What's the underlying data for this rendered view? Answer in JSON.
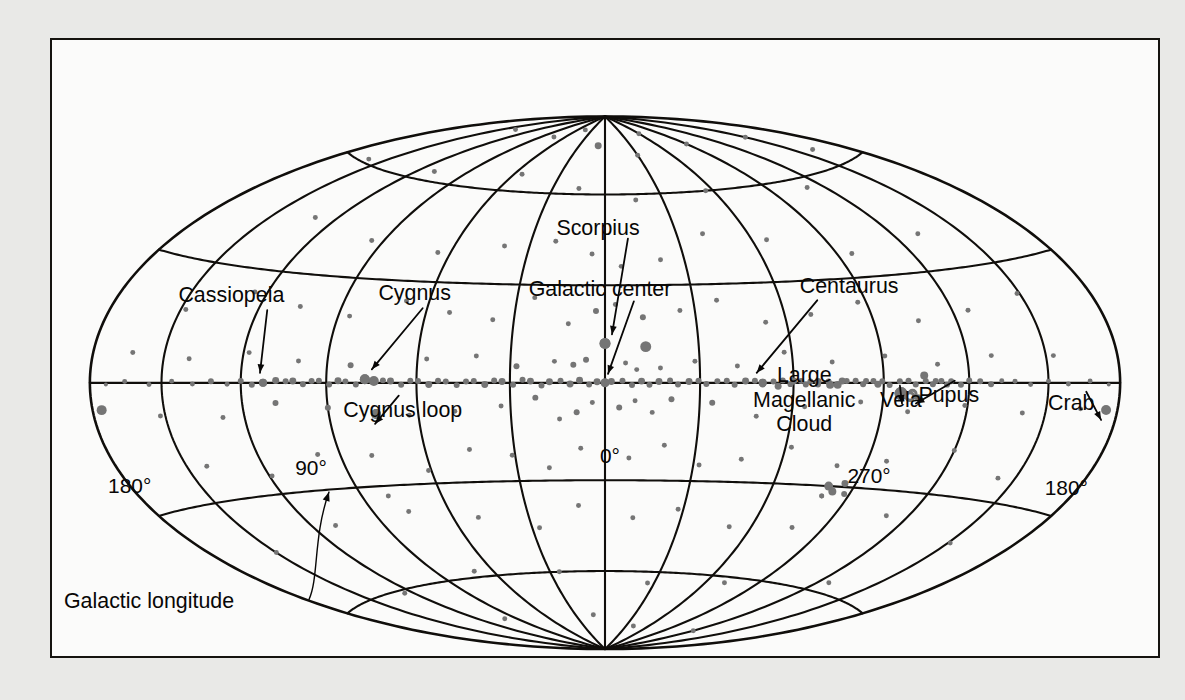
{
  "figure": {
    "kind": "all-sky-map",
    "projection": "Hammer-Aitoff",
    "coordinate_system": "galactic",
    "background_color": "#e9e9e7",
    "panel_color": "#fbfbfa",
    "line_color": "#100e0b",
    "source_color": "#757575"
  },
  "axis_labels": {
    "longitude_caption": "Galactic longitude",
    "ticks": [
      {
        "id": "left-180",
        "text": "180°",
        "x": 78,
        "y": 450
      },
      {
        "id": "left-90",
        "text": "90°",
        "x": 260,
        "y": 432
      },
      {
        "id": "center-0",
        "text": "0°",
        "x": 560,
        "y": 420
      },
      {
        "id": "right-270",
        "text": "270°",
        "x": 820,
        "y": 440
      },
      {
        "id": "right-180",
        "text": "180°",
        "x": 1018,
        "y": 452
      }
    ]
  },
  "annotations": [
    {
      "id": "scorpius",
      "lines": [
        "Scorpius"
      ],
      "x": 548,
      "y": 190,
      "anchor": "middle"
    },
    {
      "id": "galactic-center",
      "lines": [
        "Galactic center"
      ],
      "x": 550,
      "y": 252,
      "anchor": "middle"
    },
    {
      "id": "cassiopeia",
      "lines": [
        "Cassiopeia"
      ],
      "x": 180,
      "y": 258,
      "anchor": "middle"
    },
    {
      "id": "cygnus",
      "lines": [
        "Cygnus"
      ],
      "x": 364,
      "y": 256,
      "anchor": "middle"
    },
    {
      "id": "cygnus-loop",
      "lines": [
        "Cygnus loop"
      ],
      "x": 352,
      "y": 373,
      "anchor": "middle"
    },
    {
      "id": "centaurus",
      "lines": [
        "Centaurus"
      ],
      "x": 800,
      "y": 249,
      "anchor": "middle"
    },
    {
      "id": "lmc",
      "lines": [
        "Large",
        "Magellanic",
        "Cloud"
      ],
      "x": 755,
      "y": 338,
      "anchor": "middle"
    },
    {
      "id": "vela",
      "lines": [
        "Vela"
      ],
      "x": 852,
      "y": 363,
      "anchor": "middle"
    },
    {
      "id": "pupus",
      "lines": [
        "Pupus"
      ],
      "x": 900,
      "y": 358,
      "anchor": "middle"
    },
    {
      "id": "crab",
      "lines": [
        "Crab"
      ],
      "x": 1023,
      "y": 366,
      "anchor": "middle"
    }
  ],
  "chart_data": {
    "type": "scatter",
    "title": "",
    "projection": "Hammer-Aitoff all-sky (galactic coordinates)",
    "xlabel": "Galactic longitude",
    "ylabel": "Galactic latitude",
    "xlim": [
      180,
      -180
    ],
    "ylim": [
      -90,
      90
    ],
    "grid": true,
    "graticule": {
      "meridian_step_deg": 30,
      "parallel_step_deg": 30,
      "labeled_meridians": [
        180,
        90,
        0,
        270,
        180
      ],
      "labeled_parallels": []
    },
    "legend": "none",
    "marker_size_meaning": "source brightness / flux",
    "named_sources": [
      {
        "name": "Scorpius",
        "l": 0,
        "b": 12,
        "size": 11
      },
      {
        "name": "Galactic center",
        "l": 0,
        "b": 0,
        "size": 8
      },
      {
        "name": "Cassiopeia",
        "l": 112,
        "b": 0,
        "size": 8
      },
      {
        "name": "Cygnus",
        "l": 77,
        "b": 1,
        "size": 10
      },
      {
        "name": "Cygnus loop",
        "l": 74,
        "b": -9,
        "size": 10
      },
      {
        "name": "Centaurus",
        "l": 310,
        "b": 0,
        "size": 8
      },
      {
        "name": "Large Magellanic Cloud",
        "l": 280,
        "b": -33,
        "size": 5
      },
      {
        "name": "Vela",
        "l": 264,
        "b": -3,
        "size": 13,
        "marker": "disc"
      },
      {
        "name": "Pupus",
        "l": 260,
        "b": -3,
        "size": 7,
        "marker": "ring"
      },
      {
        "name": "Crab",
        "l": 185,
        "b": -6,
        "size": 10
      }
    ],
    "points": [
      [
        0.0,
        0.0,
        9
      ],
      [
        2.5,
        0.3,
        7
      ],
      [
        -2.0,
        0.4,
        7
      ],
      [
        5.0,
        -0.5,
        6
      ],
      [
        -5.5,
        0.6,
        6
      ],
      [
        8.0,
        0.8,
        7
      ],
      [
        -8.5,
        -0.7,
        6
      ],
      [
        11.0,
        -0.4,
        7
      ],
      [
        -11.5,
        0.5,
        7
      ],
      [
        14.0,
        0.6,
        6
      ],
      [
        -14.0,
        -0.6,
        6
      ],
      [
        17.5,
        0.3,
        7
      ],
      [
        -17.0,
        0.4,
        7
      ],
      [
        20.0,
        -0.8,
        6
      ],
      [
        -20.5,
        0.7,
        6
      ],
      [
        23.5,
        0.5,
        7
      ],
      [
        -23.0,
        -0.5,
        6
      ],
      [
        26.0,
        0.9,
        6
      ],
      [
        -26.5,
        0.4,
        7
      ],
      [
        29.0,
        -0.6,
        6
      ],
      [
        -29.5,
        0.6,
        6
      ],
      [
        32.5,
        0.4,
        7
      ],
      [
        -32.0,
        -0.4,
        6
      ],
      [
        35.0,
        0.7,
        6
      ],
      [
        -35.5,
        0.5,
        6
      ],
      [
        38.0,
        -0.5,
        7
      ],
      [
        -38.5,
        0.6,
        6
      ],
      [
        41.5,
        0.5,
        6
      ],
      [
        -41.0,
        -0.6,
        6
      ],
      [
        44.0,
        0.4,
        6
      ],
      [
        -44.5,
        0.5,
        7
      ],
      [
        47.0,
        -0.7,
        6
      ],
      [
        -47.5,
        0.6,
        6
      ],
      [
        50.5,
        0.4,
        6
      ],
      [
        -50.0,
        -0.5,
        6
      ],
      [
        53.0,
        0.6,
        6
      ],
      [
        -53.5,
        0.4,
        6
      ],
      [
        56.0,
        -0.5,
        7
      ],
      [
        -56.5,
        0.7,
        6
      ],
      [
        59.5,
        0.5,
        6
      ],
      [
        -59.0,
        -0.4,
        6
      ],
      [
        62.0,
        0.6,
        6
      ],
      [
        -62.5,
        0.5,
        6
      ],
      [
        65.0,
        -0.6,
        6
      ],
      [
        -65.5,
        0.4,
        6
      ],
      [
        68.5,
        0.5,
        7
      ],
      [
        -68.0,
        -0.5,
        6
      ],
      [
        71.0,
        0.7,
        6
      ],
      [
        -71.5,
        0.4,
        6
      ],
      [
        74.0,
        0.5,
        10
      ],
      [
        -74.5,
        -0.6,
        8
      ],
      [
        77.0,
        1.0,
        10
      ],
      [
        -77.5,
        0.5,
        6
      ],
      [
        80.0,
        -0.5,
        6
      ],
      [
        -80.5,
        0.6,
        6
      ],
      [
        83.5,
        0.4,
        6
      ],
      [
        -83.0,
        -0.4,
        6
      ],
      [
        86.0,
        0.6,
        7
      ],
      [
        -86.5,
        0.5,
        6
      ],
      [
        89.0,
        -0.5,
        6
      ],
      [
        -89.5,
        0.4,
        6
      ],
      [
        92.5,
        0.6,
        6
      ],
      [
        -92.0,
        -0.6,
        6
      ],
      [
        95.0,
        0.5,
        6
      ],
      [
        -95.5,
        0.4,
        6
      ],
      [
        98.0,
        -0.4,
        6
      ],
      [
        -98.5,
        0.6,
        6
      ],
      [
        101.5,
        0.5,
        7
      ],
      [
        -101.0,
        -0.5,
        6
      ],
      [
        104.0,
        0.4,
        6
      ],
      [
        107.5,
        0.6,
        7
      ],
      [
        112.0,
        0.0,
        8
      ],
      [
        116.0,
        -0.5,
        6
      ],
      [
        120.0,
        0.5,
        6
      ],
      [
        125.0,
        -0.4,
        5
      ],
      [
        131.0,
        0.4,
        6
      ],
      [
        138.0,
        -0.3,
        5
      ],
      [
        146.0,
        0.4,
        5
      ],
      [
        155.0,
        -0.4,
        5
      ],
      [
        165.0,
        0.3,
        5
      ],
      [
        173.0,
        -0.4,
        4
      ],
      [
        -104.5,
        0.5,
        6
      ],
      [
        -107.0,
        -0.4,
        6
      ],
      [
        -110.0,
        0.5,
        6
      ],
      [
        -113.5,
        0.4,
        6
      ],
      [
        -117.0,
        -0.5,
        6
      ],
      [
        -120.0,
        0.6,
        6
      ],
      [
        -124.0,
        0.4,
        6
      ],
      [
        -128.0,
        -0.4,
        6
      ],
      [
        -132.0,
        0.5,
        5
      ],
      [
        -137.0,
        0.4,
        5
      ],
      [
        -143.0,
        -0.4,
        5
      ],
      [
        -150.0,
        0.4,
        5
      ],
      [
        -158.0,
        -0.3,
        5
      ],
      [
        -167.0,
        0.4,
        5
      ],
      [
        -175.0,
        -0.4,
        4
      ],
      [
        176.0,
        -6.0,
        10
      ],
      [
        0.0,
        12.0,
        11
      ],
      [
        -13.0,
        11.0,
        11
      ],
      [
        6.0,
        7.0,
        6
      ],
      [
        -6.5,
        6.0,
        5
      ],
      [
        10.0,
        5.5,
        6
      ],
      [
        -10.0,
        4.0,
        5
      ],
      [
        16.0,
        6.5,
        5
      ],
      [
        -17.5,
        4.5,
        5
      ],
      [
        22.0,
        -4.5,
        6
      ],
      [
        -21.0,
        -5.0,
        6
      ],
      [
        4.0,
        -6.0,
        5
      ],
      [
        -4.5,
        -7.5,
        6
      ],
      [
        9.0,
        -9.0,
        6
      ],
      [
        -9.5,
        -5.5,
        5
      ],
      [
        14.5,
        -11.0,
        5
      ],
      [
        -15.0,
        -9.0,
        5
      ],
      [
        28.0,
        5.0,
        6
      ],
      [
        -28.5,
        6.5,
        5
      ],
      [
        33.0,
        -7.0,
        5
      ],
      [
        -34.0,
        -6.0,
        6
      ],
      [
        41.0,
        8.0,
        5
      ],
      [
        -42.0,
        5.0,
        5
      ],
      [
        48.0,
        -8.5,
        5
      ],
      [
        -48.5,
        -10.0,
        5
      ],
      [
        57.0,
        7.0,
        5
      ],
      [
        -57.5,
        9.0,
        5
      ],
      [
        63.0,
        -9.5,
        5
      ],
      [
        -64.0,
        -7.0,
        5
      ],
      [
        74.0,
        -9.0,
        10
      ],
      [
        -73.0,
        6.0,
        5
      ],
      [
        82.0,
        5.0,
        6
      ],
      [
        -82.5,
        -5.5,
        5
      ],
      [
        90.0,
        -7.0,
        6
      ],
      [
        -91.0,
        7.5,
        5
      ],
      [
        100.0,
        6.0,
        5
      ],
      [
        -99.0,
        -8.0,
        5
      ],
      [
        108.0,
        -5.5,
        6
      ],
      [
        -109.0,
        5.0,
        5
      ],
      [
        118.0,
        8.0,
        5
      ],
      [
        -119.0,
        -6.0,
        5
      ],
      [
        128.0,
        -9.0,
        5
      ],
      [
        -129.0,
        7.0,
        5
      ],
      [
        140.0,
        6.0,
        5
      ],
      [
        -141.0,
        -7.5,
        5
      ],
      [
        152.0,
        -8.0,
        5
      ],
      [
        -153.0,
        6.5,
        5
      ],
      [
        163.0,
        7.0,
        5
      ],
      [
        -164.0,
        -6.0,
        5
      ],
      [
        3.0,
        22.0,
        6
      ],
      [
        -3.5,
        24.0,
        5
      ],
      [
        12.0,
        18.0,
        5
      ],
      [
        -12.5,
        20.0,
        6
      ],
      [
        24.0,
        26.0,
        5
      ],
      [
        -25.0,
        22.0,
        5
      ],
      [
        37.0,
        19.0,
        5
      ],
      [
        -38.0,
        25.0,
        5
      ],
      [
        52.0,
        21.0,
        5
      ],
      [
        -53.0,
        18.0,
        5
      ],
      [
        68.0,
        24.0,
        5
      ],
      [
        -69.0,
        20.0,
        5
      ],
      [
        86.0,
        19.0,
        5
      ],
      [
        -87.0,
        23.0,
        5
      ],
      [
        105.0,
        21.0,
        5
      ],
      [
        -106.0,
        17.0,
        5
      ],
      [
        125.0,
        24.0,
        5
      ],
      [
        -126.0,
        19.0,
        5
      ],
      [
        148.0,
        18.0,
        5
      ],
      [
        -149.0,
        22.0,
        5
      ],
      [
        8.0,
        -20.0,
        5
      ],
      [
        -8.0,
        -23.0,
        5
      ],
      [
        19.0,
        -26.0,
        5
      ],
      [
        -19.5,
        -19.0,
        5
      ],
      [
        31.0,
        -22.0,
        5
      ],
      [
        -32.0,
        -25.0,
        5
      ],
      [
        45.0,
        -20.0,
        5
      ],
      [
        -46.0,
        -23.0,
        5
      ],
      [
        61.0,
        -26.0,
        5
      ],
      [
        -62.0,
        -19.0,
        5
      ],
      [
        79.0,
        -21.0,
        5
      ],
      [
        -80.0,
        -24.0,
        5
      ],
      [
        98.0,
        -20.0,
        5
      ],
      [
        -97.0,
        -22.0,
        5
      ],
      [
        119.0,
        -25.0,
        5
      ],
      [
        -120.0,
        -18.0,
        5
      ],
      [
        142.0,
        -21.0,
        5
      ],
      [
        -143.0,
        -24.0,
        5
      ],
      [
        5.0,
        40.0,
        5
      ],
      [
        -6.0,
        36.0,
        5
      ],
      [
        20.0,
        44.0,
        5
      ],
      [
        -21.0,
        38.0,
        5
      ],
      [
        40.0,
        42.0,
        5
      ],
      [
        -41.0,
        46.0,
        5
      ],
      [
        65.0,
        39.0,
        5
      ],
      [
        -66.0,
        43.0,
        5
      ],
      [
        95.0,
        41.0,
        5
      ],
      [
        -96.0,
        37.0,
        5
      ],
      [
        130.0,
        45.0,
        5
      ],
      [
        -131.0,
        40.0,
        5
      ],
      [
        10.0,
        -38.0,
        5
      ],
      [
        -11.0,
        -42.0,
        5
      ],
      [
        27.0,
        -45.0,
        5
      ],
      [
        -28.0,
        -39.0,
        5
      ],
      [
        50.0,
        -41.0,
        5
      ],
      [
        -51.0,
        -44.0,
        5
      ],
      [
        76.0,
        -38.0,
        5
      ],
      [
        -77.0,
        -43.0,
        5
      ],
      [
        110.0,
        -40.0,
        5
      ],
      [
        -111.0,
        -37.0,
        5
      ],
      [
        150.0,
        -44.0,
        5
      ],
      [
        -151.0,
        -41.0,
        5
      ],
      [
        15.0,
        62.0,
        5
      ],
      [
        -16.0,
        58.0,
        5
      ],
      [
        55.0,
        66.0,
        5
      ],
      [
        -56.0,
        60.0,
        5
      ],
      [
        110.0,
        63.0,
        5
      ],
      [
        -111.0,
        57.0,
        5
      ],
      [
        160.0,
        61.0,
        5
      ],
      [
        -161.0,
        65.0,
        5
      ],
      [
        25.0,
        -60.0,
        5
      ],
      [
        -26.0,
        -64.0,
        5
      ],
      [
        70.0,
        -58.0,
        5
      ],
      [
        -71.0,
        -62.0,
        5
      ],
      [
        125.0,
        -61.0,
        5
      ],
      [
        -126.0,
        -57.0,
        5
      ],
      [
        8.0,
        78.0,
        7
      ],
      [
        -30.0,
        74.0,
        5
      ],
      [
        75.0,
        80.0,
        5
      ],
      [
        -90.0,
        76.0,
        5
      ],
      [
        140.0,
        79.0,
        5
      ],
      [
        -150.0,
        73.0,
        5
      ],
      [
        45.0,
        84.0,
        5
      ],
      [
        -60.0,
        82.0,
        5
      ],
      [
        12.0,
        -76.0,
        5
      ],
      [
        -40.0,
        -80.0,
        5
      ],
      [
        100.0,
        -74.0,
        5
      ],
      [
        -120.0,
        -78.0,
        5
      ],
      [
        80.0,
        -33.0,
        5
      ],
      [
        -80.5,
        -30.0,
        9
      ],
      [
        -83.0,
        -31.5,
        8
      ],
      [
        -86.0,
        -29.0,
        7
      ],
      [
        -88.0,
        -32.0,
        6
      ],
      [
        310.0,
        0.0,
        8
      ],
      [
        305.0,
        -1.0,
        7
      ],
      [
        300.0,
        0.5,
        7
      ],
      [
        296.0,
        -0.5,
        6
      ],
      [
        292.0,
        0.4,
        7
      ],
      [
        288.0,
        -0.6,
        8
      ],
      [
        284.0,
        0.5,
        7
      ],
      [
        280.0,
        -33.0,
        5
      ],
      [
        276.0,
        0.5,
        6
      ],
      [
        272.0,
        -0.4,
        7
      ],
      [
        264.0,
        -3.0,
        13
      ],
      [
        260.0,
        -3.0,
        7
      ],
      [
        256.0,
        2.0,
        8
      ],
      [
        252.0,
        0.5,
        6
      ],
      [
        248.0,
        -0.5,
        6
      ]
    ]
  }
}
